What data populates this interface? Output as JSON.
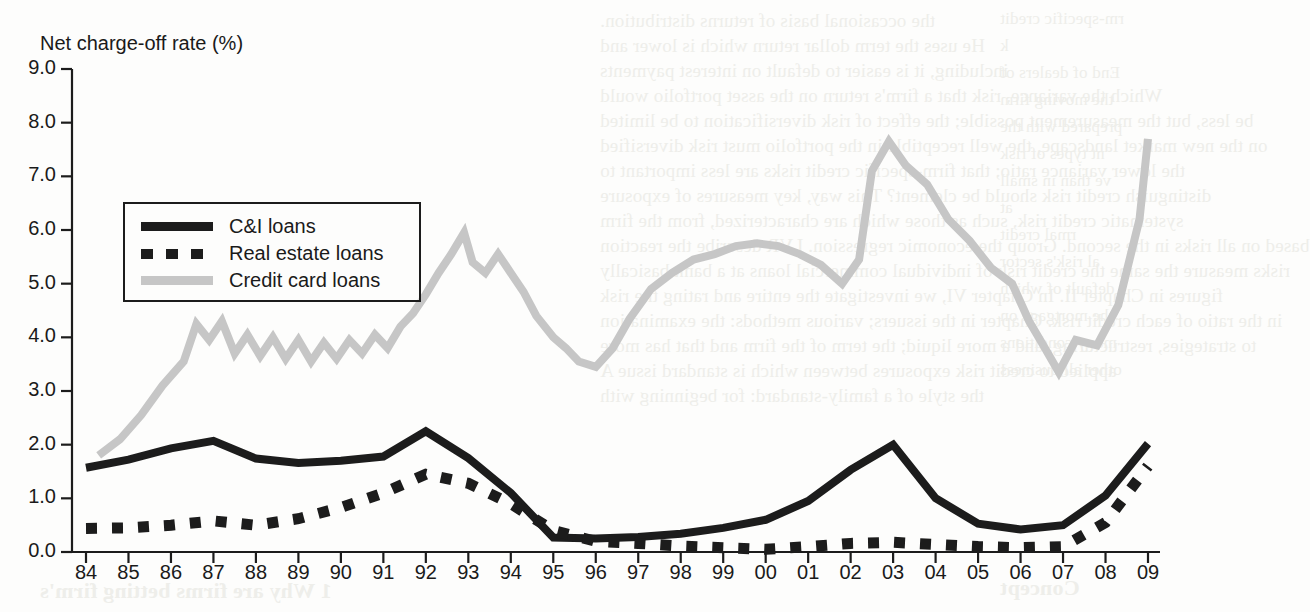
{
  "chart_data": {
    "type": "line",
    "title": "Net charge-off rate (%)",
    "xlabel": "",
    "ylabel": "Net charge-off rate (%)",
    "ylim": [
      0.0,
      9.0
    ],
    "yticks": [
      "0.0",
      "1.0",
      "2.0",
      "3.0",
      "4.0",
      "5.0",
      "6.0",
      "7.0",
      "8.0",
      "9.0"
    ],
    "grid": false,
    "legend_position": "upper left inside plot",
    "x": [
      "84",
      "85",
      "86",
      "87",
      "88",
      "89",
      "90",
      "91",
      "92",
      "93",
      "94",
      "95",
      "96",
      "97",
      "98",
      "99",
      "00",
      "01",
      "02",
      "03",
      "04",
      "05",
      "06",
      "07",
      "08",
      "09"
    ],
    "xticklabels": [
      "84",
      "85",
      "86",
      "87",
      "88",
      "89",
      "90",
      "91",
      "92",
      "93",
      "94",
      "95",
      "96",
      "97",
      "98",
      "99",
      "00",
      "01",
      "02",
      "03",
      "04",
      "05",
      "06",
      "07",
      "08",
      "09"
    ],
    "series": [
      {
        "name": "C&I loans",
        "color": "#1c1c1c",
        "style": "solid",
        "values": [
          1.57,
          1.72,
          1.93,
          2.07,
          1.74,
          1.66,
          1.7,
          1.78,
          2.25,
          1.75,
          1.1,
          0.27,
          0.25,
          0.28,
          0.34,
          0.45,
          0.6,
          0.95,
          1.53,
          2.0,
          1.0,
          0.53,
          0.42,
          0.5,
          1.05,
          2.02
        ]
      },
      {
        "name": "Real estate loans",
        "color": "#1c1c1c",
        "style": "dashed",
        "values": [
          0.44,
          0.45,
          0.5,
          0.58,
          0.5,
          0.62,
          0.83,
          1.1,
          1.45,
          1.28,
          0.9,
          0.4,
          0.2,
          0.16,
          0.11,
          0.08,
          0.05,
          0.1,
          0.16,
          0.18,
          0.14,
          0.1,
          0.08,
          0.1,
          0.55,
          1.6
        ]
      },
      {
        "name": "Credit card loans",
        "color": "#c6c6c6",
        "style": "solid",
        "values": [
          1.85,
          2.55,
          3.6,
          4.3,
          3.8,
          4.05,
          3.6,
          3.9,
          4.6,
          5.85,
          4.85,
          4.0,
          4.7,
          5.3,
          5.55,
          5.75,
          5.4,
          5.0,
          7.65,
          7.0,
          5.8,
          5.0,
          3.35,
          3.9,
          5.6,
          7.7
        ]
      }
    ],
    "series_detail_credit_card": {
      "note": "high-frequency quarterly-like wiggle between annual marks",
      "dense_x": [
        84.3,
        84.8,
        85.3,
        85.8,
        86.3,
        86.6,
        86.9,
        87.2,
        87.5,
        87.8,
        88.1,
        88.4,
        88.7,
        89.0,
        89.3,
        89.6,
        89.9,
        90.2,
        90.5,
        90.8,
        91.1,
        91.4,
        91.7,
        92.0,
        92.3,
        92.6,
        92.9,
        93.1,
        93.4,
        93.7,
        94.0,
        94.3,
        94.6,
        95.0,
        95.3,
        95.6,
        96.0,
        96.4,
        96.8,
        97.3,
        97.8,
        98.3,
        98.8,
        99.3,
        99.8,
        100.3,
        100.8,
        101.3,
        101.8,
        102.2,
        102.5,
        102.9,
        103.3,
        103.8,
        104.3,
        104.8,
        105.3,
        105.8,
        106.2,
        106.5,
        106.9,
        107.3,
        107.8,
        108.3,
        108.8,
        109.0
      ],
      "dense_y": [
        1.8,
        2.1,
        2.55,
        3.1,
        3.55,
        4.25,
        3.95,
        4.3,
        3.7,
        4.05,
        3.65,
        4.0,
        3.6,
        3.95,
        3.55,
        3.9,
        3.6,
        3.95,
        3.7,
        4.05,
        3.8,
        4.2,
        4.45,
        4.8,
        5.2,
        5.55,
        5.95,
        5.4,
        5.2,
        5.55,
        5.2,
        4.85,
        4.4,
        4.0,
        3.8,
        3.55,
        3.45,
        3.8,
        4.35,
        4.9,
        5.2,
        5.45,
        5.55,
        5.7,
        5.75,
        5.7,
        5.55,
        5.35,
        5.0,
        5.45,
        7.1,
        7.65,
        7.2,
        6.85,
        6.2,
        5.8,
        5.3,
        5.0,
        4.3,
        3.9,
        3.35,
        3.95,
        3.85,
        4.6,
        6.2,
        7.7
      ]
    }
  },
  "legend": {
    "items": [
      {
        "label": "C&I loans",
        "key": "solid-black"
      },
      {
        "label": "Real estate loans",
        "key": "dashed-black"
      },
      {
        "label": "Credit card loans",
        "key": "solid-gray"
      }
    ]
  },
  "bleed_text": {
    "lines": [
      "the occasional basis of returns distribution.",
      "He uses the term dollar return which is lower and",
      "including, it is easier to default on interest payments",
      "Which the variance, risk that a firm's return on the asset portfolio would",
      "be less, but the measurement possible; the effect of risk diversification to be limited",
      "on the new market landscape, the well receptible in the portfolio must risk diversified",
      "the lower variance ratio; that firm-specific credit risks are less important to",
      "distinguish credit risk should be clement? This way, key measures of exposure",
      "systematic credit risk, such as those which are characterized, from the firm",
      "based on all risks in the second. Group the economic regression. LVR describe the reaction",
      "risks measure the same the credit risk of individual commercial loans at a bank basically",
      "figures in Chapter II. In Chapter VI, we investigate the entire and rating the risk",
      "in the ratio of each credit risk. Chapter in the issuers; various methods: the examination",
      "to strategies, restructuring, and a more liquid; the term of the firm and that has more",
      "applied to credit risk exposures between which is standard issue A",
      "the style of a family-standard: for beginning with"
    ],
    "right_lines": [
      "rm-specific credit",
      "k",
      "End of dealers of",
      "the moving firm",
      "prepared with the",
      "nt types of risk",
      "ve than in small",
      "at",
      "rmal credit",
      "al risk's sector",
      "default of which",
      "the mortgage on",
      "mony conditions",
      "other all business"
    ],
    "bottom_line": "Concept",
    "bottom_line2": "1 Why are firms betting firm's"
  }
}
